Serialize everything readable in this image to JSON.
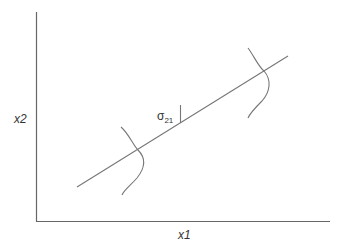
{
  "diagram": {
    "type": "regression-line-with-conditional-distributions",
    "axes": {
      "x_label": "x1",
      "y_label": "x2",
      "color": "#666666"
    },
    "line_color": "#777777",
    "annotation": {
      "symbol": "σ",
      "subscript": "21"
    },
    "elements": [
      {
        "id": "regression-line",
        "from": [
          77,
          187
        ],
        "to": [
          288,
          56
        ]
      },
      {
        "id": "left-distribution",
        "center_on_line": [
          138,
          149
        ]
      },
      {
        "id": "right-distribution",
        "center_on_line": [
          264,
          71
        ]
      },
      {
        "id": "sigma-tick",
        "x": 180,
        "y_top": 105,
        "y_bottom": 123
      }
    ]
  }
}
